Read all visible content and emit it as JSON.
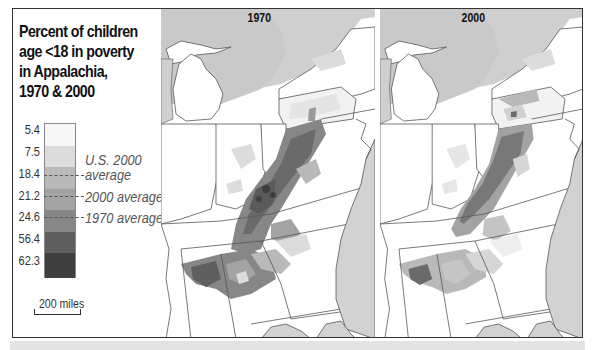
{
  "title": {
    "lines": [
      "Percent of children",
      "age <18 in poverty",
      "in Appalachia,",
      "1970 & 2000"
    ]
  },
  "legend": {
    "breaks": [
      "5.4",
      "7.5",
      "18.4",
      "21.2",
      "24.6",
      "56.4",
      "62.3"
    ],
    "colors": [
      "#f7f7f7",
      "#dcdcdc",
      "#b9b9b9",
      "#a3a3a3",
      "#878787",
      "#5f5f5f",
      "#3e3e3e"
    ],
    "averages": [
      {
        "label_line1": "U.S. 2000",
        "label_line2": "average",
        "value": "18.4"
      },
      {
        "label": "2000 average",
        "value": "21.2"
      },
      {
        "label": "1970 average",
        "value": "24.6"
      }
    ]
  },
  "scale": {
    "label": "200 miles"
  },
  "maps": [
    {
      "year": "1970"
    },
    {
      "year": "2000"
    }
  ],
  "colors": {
    "water": "#d2d2d2",
    "land": "#ffffff",
    "border": "#555555",
    "frame": "#333333",
    "bottom_strip": "#e3e3e3"
  }
}
